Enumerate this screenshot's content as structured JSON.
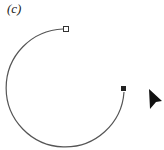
{
  "figure": {
    "label": "(c)",
    "arc": {
      "start": [
        63,
        29
      ],
      "end": [
        124,
        92
      ],
      "center": [
        68,
        88
      ],
      "radius": 59,
      "stroke": "#555555"
    },
    "anchors": [
      {
        "type": "open-square",
        "x": 66,
        "y": 29
      },
      {
        "type": "filled-square",
        "x": 124,
        "y": 89
      }
    ],
    "cursor": {
      "type": "arrow",
      "x": 148,
      "y": 88,
      "color": "#111111"
    }
  }
}
